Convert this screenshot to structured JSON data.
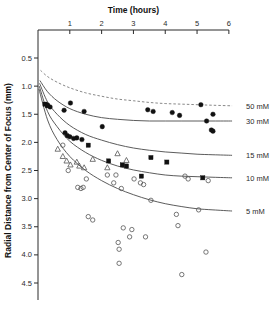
{
  "chart_data": {
    "type": "scatter",
    "title": "",
    "xlabel": "Time (hours)",
    "ylabel": "Radial Distance from Center of Focus (mm)",
    "xlim": [
      0,
      6.35
    ],
    "ylim": [
      0.35,
      4.8
    ],
    "y_inverted": true,
    "x_axis_position": "top",
    "grid": false,
    "legend_position": "right-of-curve-ends",
    "xticks": [
      1,
      2,
      3,
      4,
      5,
      6
    ],
    "xticklabels": [
      "1",
      "2",
      "3",
      "4",
      "5",
      "6"
    ],
    "yticks": [
      0.5,
      1.0,
      1.5,
      2.0,
      2.5,
      3.0,
      3.5,
      4.0,
      4.5
    ],
    "yticklabels": [
      "0.5",
      "1.0",
      "1.5",
      "2.0",
      "2.5",
      "3.0",
      "3.5",
      "4.0",
      "4.5"
    ],
    "series": [
      {
        "name": "50 mM",
        "label": "50 mM",
        "marker": "filled-circle",
        "curve_style": "dashed",
        "curve": [
          [
            0.08,
            0.72
          ],
          [
            0.3,
            0.83
          ],
          [
            0.6,
            0.93
          ],
          [
            1.0,
            1.03
          ],
          [
            1.5,
            1.12
          ],
          [
            2.0,
            1.18
          ],
          [
            2.5,
            1.23
          ],
          [
            3.0,
            1.26
          ],
          [
            3.5,
            1.29
          ],
          [
            4.0,
            1.31
          ],
          [
            4.5,
            1.32
          ],
          [
            5.0,
            1.33
          ],
          [
            5.5,
            1.34
          ],
          [
            6.1,
            1.35
          ]
        ],
        "points": [
          [
            0.28,
            1.33
          ],
          [
            0.38,
            1.37
          ],
          [
            0.82,
            1.43
          ],
          [
            1.02,
            1.3
          ],
          [
            1.45,
            1.45
          ],
          [
            3.45,
            1.42
          ],
          [
            3.62,
            1.45
          ],
          [
            4.22,
            1.47
          ],
          [
            4.45,
            1.52
          ],
          [
            5.12,
            1.33
          ],
          [
            5.5,
            1.5
          ]
        ]
      },
      {
        "name": "30 mM",
        "label": "30 mM",
        "marker": "filled-circle",
        "curve_style": "solid",
        "curve": [
          [
            0.06,
            0.9
          ],
          [
            0.3,
            1.1
          ],
          [
            0.6,
            1.26
          ],
          [
            1.0,
            1.4
          ],
          [
            1.5,
            1.5
          ],
          [
            2.0,
            1.56
          ],
          [
            2.5,
            1.59
          ],
          [
            3.0,
            1.61
          ],
          [
            3.5,
            1.62
          ],
          [
            4.0,
            1.62
          ],
          [
            4.5,
            1.62
          ],
          [
            5.0,
            1.62
          ],
          [
            5.5,
            1.62
          ],
          [
            6.1,
            1.62
          ]
        ],
        "points": [
          [
            0.85,
            1.83
          ],
          [
            0.92,
            1.88
          ],
          [
            1.0,
            1.9
          ],
          [
            1.12,
            1.93
          ],
          [
            1.22,
            1.92
          ],
          [
            1.38,
            1.95
          ],
          [
            2.02,
            1.72
          ],
          [
            5.3,
            1.62
          ],
          [
            5.45,
            1.78
          ],
          [
            5.5,
            1.8
          ]
        ]
      },
      {
        "name": "15 mM",
        "label": "15 mM",
        "marker": "filled-square",
        "curve_style": "solid",
        "curve": [
          [
            0.05,
            0.95
          ],
          [
            0.3,
            1.28
          ],
          [
            0.6,
            1.5
          ],
          [
            1.0,
            1.7
          ],
          [
            1.5,
            1.86
          ],
          [
            2.0,
            1.96
          ],
          [
            2.5,
            2.04
          ],
          [
            3.0,
            2.1
          ],
          [
            3.5,
            2.14
          ],
          [
            4.0,
            2.17
          ],
          [
            4.5,
            2.19
          ],
          [
            5.0,
            2.21
          ],
          [
            5.5,
            2.22
          ],
          [
            6.1,
            2.23
          ]
        ],
        "points": [
          [
            0.22,
            1.32
          ],
          [
            0.3,
            1.35
          ],
          [
            1.58,
            2.05
          ],
          [
            2.22,
            2.33
          ],
          [
            2.65,
            2.4
          ],
          [
            2.78,
            2.42
          ],
          [
            3.25,
            2.6
          ],
          [
            3.55,
            2.27
          ],
          [
            4.05,
            2.35
          ],
          [
            5.18,
            2.63
          ]
        ]
      },
      {
        "name": "10 mM",
        "label": "10 mM",
        "marker": "open-triangle",
        "curve_style": "solid",
        "curve": [
          [
            0.04,
            1.0
          ],
          [
            0.3,
            1.45
          ],
          [
            0.6,
            1.72
          ],
          [
            1.0,
            1.98
          ],
          [
            1.5,
            2.18
          ],
          [
            2.0,
            2.32
          ],
          [
            2.5,
            2.42
          ],
          [
            3.0,
            2.49
          ],
          [
            3.5,
            2.54
          ],
          [
            4.0,
            2.58
          ],
          [
            4.5,
            2.6
          ],
          [
            5.0,
            2.61
          ],
          [
            5.5,
            2.62
          ],
          [
            6.1,
            2.63
          ]
        ],
        "points": [
          [
            0.62,
            2.12
          ],
          [
            0.78,
            2.25
          ],
          [
            0.9,
            2.33
          ],
          [
            1.02,
            2.4
          ],
          [
            1.22,
            2.35
          ],
          [
            1.3,
            2.42
          ],
          [
            1.45,
            2.45
          ],
          [
            1.72,
            2.3
          ],
          [
            2.18,
            2.45
          ],
          [
            2.5,
            2.2
          ],
          [
            2.78,
            2.32
          ]
        ]
      },
      {
        "name": "5 mM",
        "label": "5 mM",
        "marker": "open-circle",
        "curve_style": "solid",
        "curve": [
          [
            0.03,
            1.05
          ],
          [
            0.3,
            1.6
          ],
          [
            0.6,
            1.95
          ],
          [
            1.0,
            2.25
          ],
          [
            1.5,
            2.5
          ],
          [
            2.0,
            2.68
          ],
          [
            2.5,
            2.82
          ],
          [
            3.0,
            2.93
          ],
          [
            3.5,
            3.02
          ],
          [
            4.0,
            3.09
          ],
          [
            4.5,
            3.14
          ],
          [
            5.0,
            3.18
          ],
          [
            5.5,
            3.2
          ],
          [
            6.1,
            3.22
          ]
        ],
        "points": [
          [
            0.78,
            2.05
          ],
          [
            0.95,
            2.5
          ],
          [
            1.25,
            2.8
          ],
          [
            1.35,
            2.82
          ],
          [
            1.42,
            2.8
          ],
          [
            1.52,
            2.65
          ],
          [
            1.58,
            3.32
          ],
          [
            1.72,
            3.38
          ],
          [
            2.18,
            2.58
          ],
          [
            2.38,
            2.72
          ],
          [
            2.45,
            2.58
          ],
          [
            2.52,
            3.78
          ],
          [
            2.55,
            3.9
          ],
          [
            2.55,
            4.15
          ],
          [
            2.62,
            2.82
          ],
          [
            2.68,
            3.52
          ],
          [
            2.88,
            3.68
          ],
          [
            2.95,
            3.55
          ],
          [
            3.02,
            2.65
          ],
          [
            3.22,
            2.72
          ],
          [
            3.32,
            2.75
          ],
          [
            3.38,
            3.68
          ],
          [
            3.55,
            3.03
          ],
          [
            4.35,
            3.28
          ],
          [
            4.4,
            3.48
          ],
          [
            4.52,
            4.35
          ],
          [
            4.62,
            2.6
          ],
          [
            4.72,
            2.65
          ],
          [
            5.05,
            3.2
          ],
          [
            5.28,
            3.95
          ],
          [
            5.35,
            2.68
          ]
        ]
      }
    ]
  }
}
